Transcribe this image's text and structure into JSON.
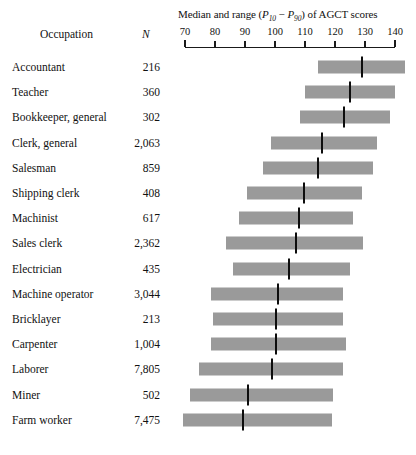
{
  "headers": {
    "occupation": "Occupation",
    "n": "N"
  },
  "axis": {
    "title_prefix": "Median and range (",
    "title_p10_base": "P",
    "title_p10_sub": "10",
    "title_dash": " − ",
    "title_p90_base": "P",
    "title_p90_sub": "90",
    "title_suffix": ") of AGCT scores",
    "title_plain": "Median and range (P10 − P90) of AGCT scores",
    "ticks": [
      70,
      80,
      90,
      100,
      110,
      120,
      130,
      140
    ],
    "min": 70,
    "max": 140
  },
  "style": {
    "bar_color": "#9a9a9a",
    "median_color": "#0d0d0d",
    "axis_color": "#1a1a1a",
    "background": "#ffffff"
  },
  "chart_data": {
    "type": "bar",
    "title": "Median and range (P10 − P90) of AGCT scores",
    "xlabel": "AGCT score",
    "ylabel": "Occupation",
    "xlim": [
      70,
      140
    ],
    "grid": false,
    "legend": null,
    "orientation": "horizontal",
    "note": "Each row is a floating range bar from P10 to P90 with a median tick mark.",
    "categories": [
      "Accountant",
      "Teacher",
      "Bookkeeper, general",
      "Clerk, general",
      "Salesman",
      "Shipping clerk",
      "Machinist",
      "Sales clerk",
      "Electrician",
      "Machine operator",
      "Bricklayer",
      "Carpenter",
      "Laborer",
      "Miner",
      "Farm worker"
    ],
    "n_labels": [
      "216",
      "360",
      "302",
      "2,063",
      "859",
      "408",
      "617",
      "2,362",
      "435",
      "3,044",
      "213",
      "1,004",
      "7,805",
      "502",
      "7,475"
    ],
    "n_values": [
      216,
      360,
      302,
      2063,
      859,
      408,
      617,
      2362,
      435,
      3044,
      213,
      1004,
      7805,
      502,
      7475
    ],
    "rows": [
      {
        "occupation": "Accountant",
        "n": "216",
        "p10": 114.3,
        "median": 129.0,
        "p90": 143.3
      },
      {
        "occupation": "Teacher",
        "n": "360",
        "p10": 110.0,
        "median": 125.0,
        "p90": 140.0
      },
      {
        "occupation": "Bookkeeper, general",
        "n": "302",
        "p10": 108.3,
        "median": 123.0,
        "p90": 138.3
      },
      {
        "occupation": "Clerk, general",
        "n": "2,063",
        "p10": 98.7,
        "median": 115.7,
        "p90": 134.0
      },
      {
        "occupation": "Salesman",
        "n": "859",
        "p10": 96.0,
        "median": 114.3,
        "p90": 132.7
      },
      {
        "occupation": "Shipping clerk",
        "n": "408",
        "p10": 90.7,
        "median": 109.7,
        "p90": 129.0
      },
      {
        "occupation": "Machinist",
        "n": "617",
        "p10": 88.0,
        "median": 108.0,
        "p90": 126.0
      },
      {
        "occupation": "Sales clerk",
        "n": "2,362",
        "p10": 83.7,
        "median": 107.0,
        "p90": 129.3
      },
      {
        "occupation": "Electrician",
        "n": "435",
        "p10": 86.0,
        "median": 104.7,
        "p90": 125.0
      },
      {
        "occupation": "Machine operator",
        "n": "3,044",
        "p10": 78.7,
        "median": 101.0,
        "p90": 122.7
      },
      {
        "occupation": "Bricklayer",
        "n": "213",
        "p10": 79.3,
        "median": 100.3,
        "p90": 122.7
      },
      {
        "occupation": "Carpenter",
        "n": "1,004",
        "p10": 78.7,
        "median": 100.3,
        "p90": 123.7
      },
      {
        "occupation": "Laborer",
        "n": "7,805",
        "p10": 74.7,
        "median": 99.0,
        "p90": 122.7
      },
      {
        "occupation": "Miner",
        "n": "502",
        "p10": 71.7,
        "median": 91.0,
        "p90": 119.3
      },
      {
        "occupation": "Farm worker",
        "n": "7,475",
        "p10": 69.3,
        "median": 89.3,
        "p90": 119.0
      }
    ]
  }
}
